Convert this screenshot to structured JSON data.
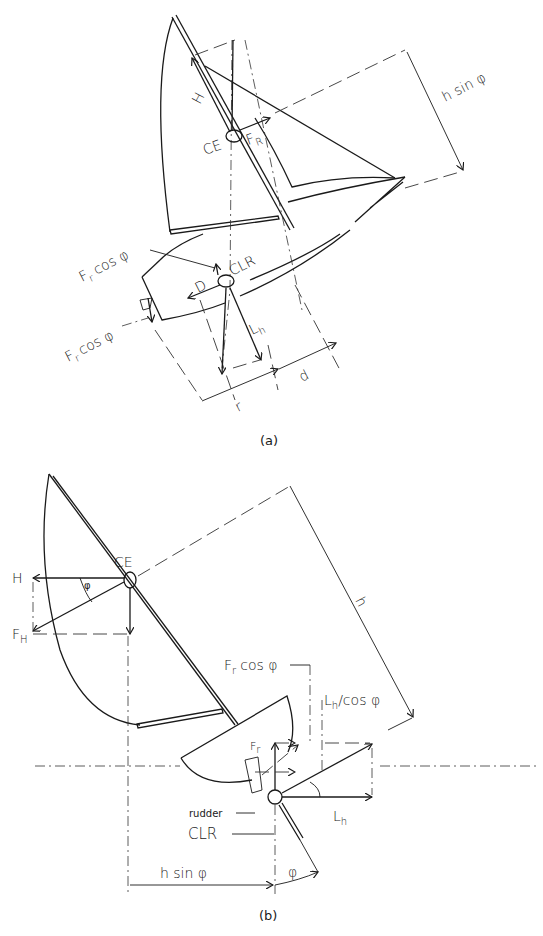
{
  "figure": {
    "panel_a": {
      "caption": "(a)",
      "labels": {
        "H": "H",
        "CE": "CE",
        "F_R": "F",
        "F_R_sub": "R",
        "h_sin_phi": "h sin φ",
        "Fr_cos_phi_top": "F",
        "Fr_cos_phi_top_rest": "cos φ",
        "Fr_sub": "r",
        "CLR": "CLR",
        "D": "D",
        "L_h": "L",
        "L_h_sub": "h",
        "Fr_cos_phi_bottom": "F",
        "Fr_cos_phi_bottom_rest": "cos φ",
        "r": "r",
        "d": "d"
      }
    },
    "panel_b": {
      "caption": "(b)",
      "labels": {
        "CE": "CE",
        "H": "H",
        "F_H": "F",
        "F_H_sub": "H",
        "phi_small": "φ",
        "h": "h",
        "Fr_cos_phi": "F",
        "Fr_cos_phi_rest": "cos φ",
        "Fr_sub": "r",
        "Lh_cos_phi": "L",
        "Lh_cos_phi_sub": "h",
        "Lh_cos_phi_rest": "/cos φ",
        "F_r": "F",
        "F_r_sub": "r",
        "rudder": "rudder",
        "CLR": "CLR",
        "L_h": "L",
        "L_h_sub": "h",
        "h_sin_phi": "h sin φ",
        "phi": "φ"
      }
    }
  },
  "colors": {
    "ink": "#1a1a1a",
    "background": "#ffffff"
  }
}
